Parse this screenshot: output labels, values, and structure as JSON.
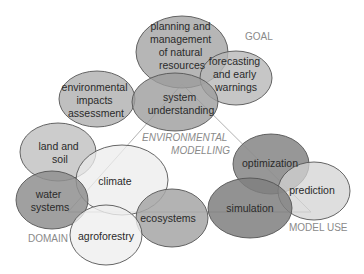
{
  "diagram": {
    "center_label": [
      "ENVIRONMENTAL",
      "MODELLING"
    ],
    "categories": {
      "goal": "GOAL",
      "domain": "DOMAIN",
      "model_use": "MODEL USE"
    },
    "goal_nodes": [
      {
        "id": "planning",
        "lines": [
          "planning and",
          "management",
          "of natural",
          "resources"
        ]
      },
      {
        "id": "forecasting",
        "lines": [
          "forecasting",
          "and early",
          "warnings"
        ]
      },
      {
        "id": "eia",
        "lines": [
          "environmental",
          "impacts",
          "assessment"
        ]
      },
      {
        "id": "system",
        "lines": [
          "system",
          "understanding"
        ]
      }
    ],
    "domain_nodes": [
      {
        "id": "land",
        "lines": [
          "land and",
          "soil"
        ]
      },
      {
        "id": "climate",
        "lines": [
          "climate"
        ]
      },
      {
        "id": "water",
        "lines": [
          "water",
          "systems"
        ]
      },
      {
        "id": "agro",
        "lines": [
          "agroforestry"
        ]
      },
      {
        "id": "eco",
        "lines": [
          "ecosystems"
        ]
      }
    ],
    "model_use_nodes": [
      {
        "id": "optim",
        "lines": [
          "optimization"
        ]
      },
      {
        "id": "pred",
        "lines": [
          "prediction"
        ]
      },
      {
        "id": "sim",
        "lines": [
          "simulation"
        ]
      }
    ],
    "colors": {
      "light": "#ececec",
      "mid_light": "#c9c9c9",
      "mid": "#b3b3b3",
      "dark": "#8f8f8f"
    }
  }
}
